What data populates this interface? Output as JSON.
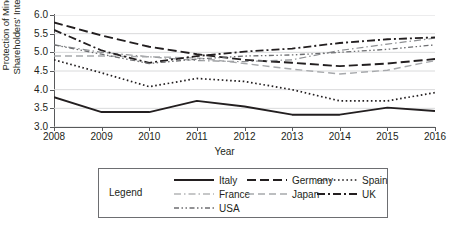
{
  "chart_data": {
    "type": "line",
    "title": "",
    "xlabel": "Year",
    "ylabel": "Protection of Minority Shareholders' Interests",
    "ylabel_line1": "Protection of Minority",
    "ylabel_line2": "Shareholders' Interests",
    "categories": [
      2008,
      2009,
      2010,
      2011,
      2012,
      2013,
      2014,
      2015,
      2016
    ],
    "x_tick_labels": [
      "2008",
      "2009",
      "2010",
      "2011",
      "2012",
      "2013",
      "2014",
      "2015",
      "2016"
    ],
    "y_tick_labels": [
      "3.0",
      "3.5",
      "4.0",
      "4.5",
      "5.0",
      "5.5",
      "6.0"
    ],
    "y_ticks": [
      3.0,
      3.5,
      4.0,
      4.5,
      5.0,
      5.5,
      6.0
    ],
    "ylim": [
      3.0,
      6.0
    ],
    "xlim": [
      2008,
      2016
    ],
    "grid": true,
    "grid_axis": "y",
    "legend_position": "below",
    "legend_title": "Legend",
    "series": [
      {
        "name": "Italy",
        "style": "solid",
        "color": "#231f20",
        "width": 1.9,
        "dash": "",
        "values": [
          3.8,
          3.4,
          3.4,
          3.7,
          3.55,
          3.33,
          3.33,
          3.52,
          3.43
        ]
      },
      {
        "name": "Germany",
        "style": "long-dash",
        "color": "#231f20",
        "width": 1.9,
        "dash": "9,4",
        "values": [
          5.8,
          5.45,
          5.15,
          4.95,
          4.8,
          4.72,
          4.63,
          4.7,
          4.82
        ]
      },
      {
        "name": "Spain",
        "style": "dotted",
        "color": "#231f20",
        "width": 1.7,
        "dash": "1.6,2.6",
        "values": [
          4.8,
          4.45,
          4.08,
          4.3,
          4.22,
          4.0,
          3.7,
          3.7,
          3.92
        ]
      },
      {
        "name": "France",
        "style": "dash-dot",
        "color": "#8d8f92",
        "width": 1.2,
        "dash": "7,3,1.5,3",
        "values": [
          5.2,
          5.0,
          4.88,
          4.78,
          4.75,
          4.8,
          5.05,
          5.22,
          5.38
        ]
      },
      {
        "name": "Japan",
        "style": "dash",
        "color": "#a7a9ac",
        "width": 1.4,
        "dash": "7,4",
        "values": [
          4.9,
          4.9,
          4.88,
          4.85,
          4.7,
          4.55,
          4.42,
          4.52,
          4.78
        ]
      },
      {
        "name": "UK",
        "style": "dash-dot-dot",
        "color": "#231f20",
        "width": 1.8,
        "dash": "8,3,2,3",
        "values": [
          5.6,
          5.05,
          4.72,
          4.9,
          5.02,
          5.1,
          5.25,
          5.35,
          5.4
        ]
      },
      {
        "name": "USA",
        "style": "dash-dot-dot-light",
        "color": "#6d6e71",
        "width": 1.3,
        "dash": "5,2.5,1.5,2.5,1.5,2.5",
        "values": [
          5.2,
          4.95,
          4.7,
          4.82,
          4.9,
          4.93,
          5.0,
          5.08,
          5.2
        ]
      }
    ],
    "legend_entries": [
      {
        "label": "Italy",
        "dash": "",
        "color": "#231f20",
        "width": 1.9
      },
      {
        "label": "Germany",
        "dash": "9,4",
        "color": "#231f20",
        "width": 1.9
      },
      {
        "label": "Spain",
        "dash": "1.6,2.6",
        "color": "#231f20",
        "width": 1.7
      },
      {
        "label": "France",
        "dash": "7,3,1.5,3",
        "color": "#8d8f92",
        "width": 1.2
      },
      {
        "label": "Japan",
        "dash": "7,4",
        "color": "#a7a9ac",
        "width": 1.4
      },
      {
        "label": "UK",
        "dash": "8,3,2,3",
        "color": "#231f20",
        "width": 1.8
      },
      {
        "label": "USA",
        "dash": "5,2.5,1.5,2.5,1.5,2.5",
        "color": "#6d6e71",
        "width": 1.3
      }
    ]
  },
  "colors": {
    "axis": "#58595b",
    "grid": "#d9dadb",
    "text": "#231f20",
    "legend_border": "#6d6e71"
  }
}
